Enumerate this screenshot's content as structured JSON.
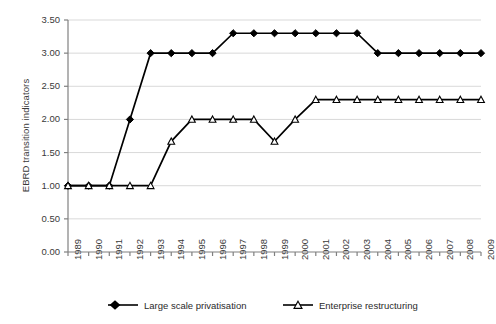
{
  "chart_data": {
    "type": "line",
    "title": "",
    "xlabel": "",
    "ylabel": "EBRD transition indicators",
    "x": [
      1989,
      1990,
      1991,
      1992,
      1993,
      1994,
      1995,
      1996,
      1997,
      1998,
      1999,
      2000,
      2001,
      2002,
      2003,
      2004,
      2005,
      2006,
      2007,
      2008,
      2009
    ],
    "categories": [
      "1989",
      "1990",
      "1991",
      "1992",
      "1993",
      "1994",
      "1995",
      "1996",
      "1997",
      "1998",
      "1999",
      "2000",
      "2001",
      "2002",
      "2003",
      "2004",
      "2005",
      "2006",
      "2007",
      "2008",
      "2009"
    ],
    "series": [
      {
        "name": "Large scale privatisation",
        "marker": "filled-diamond",
        "color": "#000000",
        "values": [
          1.0,
          1.0,
          1.0,
          2.0,
          3.0,
          3.0,
          3.0,
          3.0,
          3.3,
          3.3,
          3.3,
          3.3,
          3.3,
          3.3,
          3.3,
          3.0,
          3.0,
          3.0,
          3.0,
          3.0,
          3.0
        ]
      },
      {
        "name": "Enterprise restructuring",
        "marker": "open-triangle",
        "color": "#000000",
        "values": [
          1.0,
          1.0,
          1.0,
          1.0,
          1.0,
          1.67,
          2.0,
          2.0,
          2.0,
          2.0,
          1.67,
          2.0,
          2.3,
          2.3,
          2.3,
          2.3,
          2.3,
          2.3,
          2.3,
          2.3,
          2.3
        ]
      }
    ],
    "ylim": [
      0.0,
      3.5
    ],
    "yticks": [
      0.0,
      0.5,
      1.0,
      1.5,
      2.0,
      2.5,
      3.0,
      3.5
    ],
    "ytick_labels": [
      "0.00",
      "0.50",
      "1.00",
      "1.50",
      "2.00",
      "2.50",
      "3.00",
      "3.50"
    ],
    "grid": true,
    "grid_color": "#d9d9d9",
    "legend_position": "bottom",
    "axis_color": "#808080",
    "plot_background": "#ffffff"
  },
  "legend": {
    "entries": [
      {
        "label": "Large scale privatisation"
      },
      {
        "label": "Enterprise restructuring"
      }
    ]
  }
}
